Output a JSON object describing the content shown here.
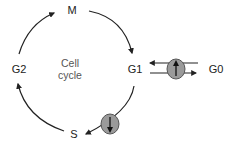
{
  "diagram": {
    "title": "Cell cycle",
    "center_label": {
      "line1": "Cell",
      "line2": "cycle"
    },
    "phases": {
      "m": "M",
      "g1": "G1",
      "s": "S",
      "g2": "G2",
      "g0": "G0"
    },
    "cycle_arrows": [
      {
        "from": "G2",
        "to": "M"
      },
      {
        "from": "M",
        "to": "G1"
      },
      {
        "from": "G1",
        "to": "S"
      },
      {
        "from": "S",
        "to": "G2"
      }
    ],
    "exchange_arrows": [
      {
        "from": "G0",
        "to": "G1"
      },
      {
        "from": "G1",
        "to": "G0"
      }
    ],
    "markers": [
      {
        "location": "G1-G0 exchange",
        "arrow": "up"
      },
      {
        "location": "G1-S transition",
        "arrow": "down"
      }
    ],
    "colors": {
      "line": "#222222",
      "marker_fill": "#9a9a9a",
      "marker_stroke": "#555555"
    }
  }
}
